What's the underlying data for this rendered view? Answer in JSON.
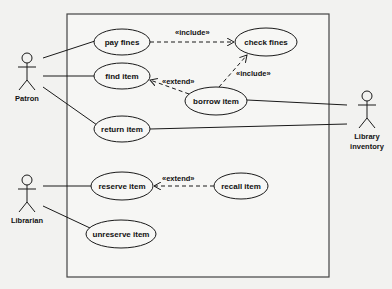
{
  "diagram": {
    "type": "uml-use-case",
    "boundary": {
      "x": 67,
      "y": 14,
      "w": 262,
      "h": 263
    },
    "actors": [
      {
        "id": "patron",
        "label": "Patron",
        "x": 27,
        "y": 58
      },
      {
        "id": "librarian",
        "label": "Librarian",
        "x": 27,
        "y": 176
      },
      {
        "id": "library_inventory",
        "label_line1": "Library",
        "label_line2": "inventory",
        "x": 365,
        "y": 98
      }
    ],
    "use_cases": [
      {
        "id": "pay_fines",
        "label": "pay fines",
        "cx": 122,
        "cy": 42,
        "rx": 28,
        "ry": 13
      },
      {
        "id": "find_item",
        "label": "find item",
        "cx": 122,
        "cy": 76,
        "rx": 28,
        "ry": 13
      },
      {
        "id": "check_fines",
        "label": "check fines",
        "cx": 266,
        "cy": 42,
        "rx": 31,
        "ry": 14
      },
      {
        "id": "borrow_item",
        "label": "borrow item",
        "cx": 216,
        "cy": 101,
        "rx": 31,
        "ry": 14
      },
      {
        "id": "return_item",
        "label": "return item",
        "cx": 122,
        "cy": 129,
        "rx": 28,
        "ry": 13
      },
      {
        "id": "reserve_item",
        "label": "reserve item",
        "cx": 122,
        "cy": 186,
        "rx": 31,
        "ry": 14
      },
      {
        "id": "recall_item",
        "label": "recall item",
        "cx": 241,
        "cy": 186,
        "rx": 27,
        "ry": 13
      },
      {
        "id": "unreserve_item",
        "label": "unreserve item",
        "cx": 121,
        "cy": 234,
        "rx": 35,
        "ry": 14
      }
    ],
    "associations": [
      {
        "from": "patron",
        "to": "pay_fines"
      },
      {
        "from": "patron",
        "to": "find_item"
      },
      {
        "from": "patron",
        "to": "return_item"
      },
      {
        "from": "librarian",
        "to": "reserve_item"
      },
      {
        "from": "librarian",
        "to": "unreserve_item"
      },
      {
        "from": "library_inventory",
        "to": "borrow_item"
      },
      {
        "from": "library_inventory",
        "to": "return_item"
      }
    ],
    "relationships": [
      {
        "from": "pay_fines",
        "to": "check_fines",
        "stereotype": "«include»"
      },
      {
        "from": "borrow_item",
        "to": "check_fines",
        "stereotype": "«include»"
      },
      {
        "from": "borrow_item",
        "to": "find_item",
        "stereotype": "«extend»"
      },
      {
        "from": "recall_item",
        "to": "reserve_item",
        "stereotype": "«extend»"
      }
    ],
    "labels": {
      "include_1": "«include»",
      "include_2": "«include»",
      "extend_1": "«extend»",
      "extend_2": "«extend»"
    }
  }
}
